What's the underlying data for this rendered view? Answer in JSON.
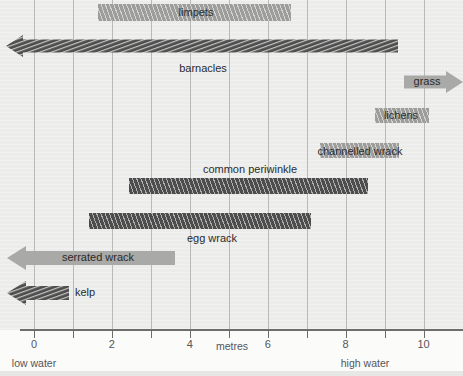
{
  "chart_data": {
    "type": "bar",
    "title": "",
    "subtitle": "",
    "xlabel": "metres",
    "ylabel": "",
    "xlim": [
      -0.9,
      11.0
    ],
    "xticks": [
      0,
      1,
      2,
      3,
      4,
      5,
      6,
      7,
      8,
      9,
      10
    ],
    "xticklabels": [
      "0",
      "",
      "2",
      "",
      "4",
      "",
      "6",
      "",
      "8",
      "",
      "10"
    ],
    "grid": true,
    "legend": "none",
    "orientation": "horizontal-ranges",
    "annotations": [
      "low water",
      "high water",
      "metres"
    ],
    "annotation_positions_m": {
      "low water": 0,
      "high water": 8.5
    },
    "categories": [
      "limpets",
      "barnacles",
      "grass",
      "lichens",
      "channelled wrack",
      "common periwinkle",
      "egg wrack",
      "serrated wrack",
      "kelp"
    ],
    "ranges": [
      {
        "name": "limpets",
        "start_m": 1.65,
        "end_m": 6.6,
        "shade": "light",
        "arrow": "none",
        "hatched": true
      },
      {
        "name": "barnacles",
        "start_m": -0.7,
        "end_m": 9.3,
        "shade": "dark",
        "arrow": "left",
        "hatched": true
      },
      {
        "name": "grass",
        "start_m": 9.55,
        "end_m": 11.0,
        "shade": "light",
        "arrow": "right",
        "hatched": false
      },
      {
        "name": "lichens",
        "start_m": 8.75,
        "end_m": 10.15,
        "shade": "light",
        "arrow": "none",
        "hatched": true
      },
      {
        "name": "channelled wrack",
        "start_m": 7.35,
        "end_m": 9.4,
        "shade": "light",
        "arrow": "none",
        "hatched": true
      },
      {
        "name": "common periwinkle",
        "start_m": 2.45,
        "end_m": 8.6,
        "shade": "dark",
        "arrow": "none",
        "hatched": true
      },
      {
        "name": "egg wrack",
        "start_m": 1.4,
        "end_m": 7.1,
        "shade": "dark",
        "arrow": "none",
        "hatched": true
      },
      {
        "name": "serrated wrack",
        "start_m": -0.7,
        "end_m": 3.6,
        "shade": "light",
        "arrow": "left",
        "hatched": false
      },
      {
        "name": "kelp",
        "start_m": -0.7,
        "end_m": 0.87,
        "shade": "dark",
        "arrow": "left",
        "hatched": true
      }
    ]
  },
  "axis": {
    "label": "metres",
    "tick_labels": [
      "0",
      "2",
      "4",
      "6",
      "8",
      "10"
    ],
    "tick_values": [
      0,
      2,
      4,
      6,
      8,
      10
    ],
    "low_water": "low water",
    "high_water": "high water"
  },
  "bars": {
    "limpets": {
      "label": "limpets"
    },
    "barnacles": {
      "label": "barnacles"
    },
    "grass": {
      "label": "grass"
    },
    "lichens": {
      "label": "lichens"
    },
    "channelled_wrack": {
      "label": "channelled wrack"
    },
    "common_periwinkle": {
      "label": "common periwinkle"
    },
    "egg_wrack": {
      "label": "egg wrack"
    },
    "serrated_wrack": {
      "label": "serrated wrack"
    },
    "kelp": {
      "label": "kelp"
    }
  },
  "colors": {
    "background": "#ececeb",
    "gridline": "#b9b9b7",
    "axis": "#6d6d6b",
    "bar_light": "#9d9d9b",
    "bar_dark": "#4d4d4d",
    "text": "#2b2b2b",
    "axis_text": "#55555a"
  }
}
